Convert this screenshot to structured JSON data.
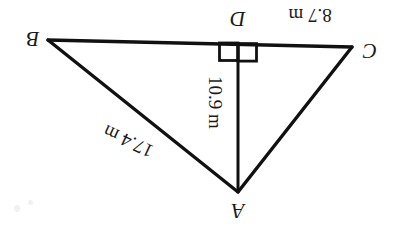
{
  "figure": {
    "orientation_note": "180-rotated scan",
    "stroke_color": "#111111",
    "background_color": "#ffffff",
    "vertices": [
      {
        "name": "B",
        "label": "B",
        "x": 48,
        "y": 40
      },
      {
        "name": "C",
        "label": "C",
        "x": 352,
        "y": 47
      },
      {
        "name": "A",
        "label": "A",
        "x": 238,
        "y": 192
      },
      {
        "name": "D",
        "label": "D",
        "x": 238,
        "y": 43
      }
    ],
    "vertex_labels": [
      {
        "name": "B",
        "label": "B",
        "x": 30,
        "y": 40
      },
      {
        "name": "C",
        "label": "C",
        "x": 370,
        "y": 52
      },
      {
        "name": "A",
        "label": "A",
        "x": 238,
        "y": 213
      },
      {
        "name": "D",
        "label": "D",
        "x": 238,
        "y": 19
      }
    ],
    "sides": [
      {
        "name": "BC",
        "from": "B",
        "to": "C"
      },
      {
        "name": "BA",
        "from": "B",
        "to": "A"
      },
      {
        "name": "AC",
        "from": "A",
        "to": "C"
      },
      {
        "name": "AD",
        "from": "A",
        "to": "D"
      }
    ],
    "measurements": [
      {
        "name": "DC",
        "value": "8.7",
        "unit": "m",
        "text": "8.7 m"
      },
      {
        "name": "AD",
        "value": "10.9",
        "unit": "m",
        "text": "10.9 m"
      },
      {
        "name": "BA",
        "value": "17.4",
        "unit": "m",
        "text": "17.4 m"
      }
    ],
    "right_angle": {
      "name": "right-angle-at-D",
      "marker_style": "double-square",
      "box_left_x": 218,
      "box_right_x": 258,
      "box_top_y": 42,
      "box_bottom_y": 61
    }
  },
  "labels": {
    "vertex_b": "B",
    "vertex_c": "C",
    "vertex_a": "A",
    "vertex_d": "D",
    "measure_dc": "8.7 m",
    "measure_dc_value": "8.7",
    "measure_dc_unit": "m",
    "measure_ad": "10.9 m",
    "measure_ad_value": "10.9",
    "measure_ad_unit": "m",
    "measure_ba": "17.4 m",
    "measure_ba_value": "17.4",
    "measure_ba_unit": "m"
  }
}
